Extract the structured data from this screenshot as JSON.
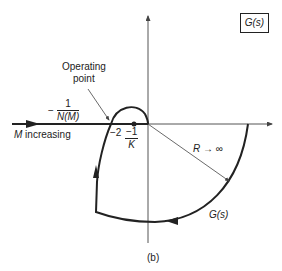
{
  "figure": {
    "title_box": "G(s)",
    "caption": "(b)",
    "labels": {
      "operating_point_line1": "Operating",
      "operating_point_line2": "point",
      "describing_function_sign": "−",
      "describing_function_num": "1",
      "describing_function_den": "N(M)",
      "m_increasing_italic": "M",
      "m_increasing_rest": " increasing",
      "tick_minus2": "−2",
      "tick_minus_inv_k_num": "−1",
      "tick_minus_inv_k_den": "K",
      "radius": "R → ∞",
      "curve_label": "G(s)"
    },
    "colors": {
      "stroke": "#222222",
      "axis": "#555555",
      "background": "#ffffff"
    }
  }
}
